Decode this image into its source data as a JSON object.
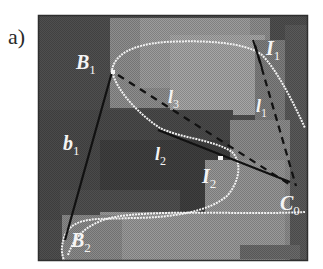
{
  "figure": {
    "panel_label": "a)",
    "labels": {
      "B1": {
        "main": "B",
        "sub": "1"
      },
      "B2": {
        "main": "B",
        "sub": "2"
      },
      "I1": {
        "main": "I",
        "sub": "1"
      },
      "I2": {
        "main": "I",
        "sub": "2"
      },
      "C0": {
        "main": "C",
        "sub": "0"
      },
      "b1": {
        "main": "b",
        "sub": "1"
      },
      "l1": {
        "main": "l",
        "sub": "1"
      },
      "l2": {
        "main": "l",
        "sub": "2"
      },
      "l3": {
        "main": "l",
        "sub": "3"
      }
    },
    "colors": {
      "frame": "#3a3a3a",
      "dark_region": "#555555",
      "mid_region": "#8a8a8a",
      "light_region": "#a8a8a8",
      "contour": "#f2f2f2",
      "line": "#111111"
    }
  }
}
